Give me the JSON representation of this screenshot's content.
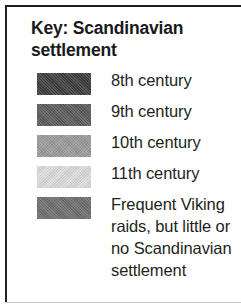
{
  "legend": {
    "title": "Key: Scandinavian settlement",
    "border_color": "#231f20",
    "text_color": "#231f20",
    "background": "#ffffff",
    "entries": [
      {
        "swatch_name": "swatch-8th-century",
        "color": "#3c3c3c",
        "label": "8th century",
        "lines": [
          "8th century"
        ]
      },
      {
        "swatch_name": "swatch-9th-century",
        "color": "#5a5a5a",
        "label": "9th century",
        "lines": [
          "9th century"
        ]
      },
      {
        "swatch_name": "swatch-10th-century",
        "color": "#9b9b9b",
        "label": "10th century",
        "lines": [
          "10th century"
        ]
      },
      {
        "swatch_name": "swatch-11th-century",
        "color": "#dedede",
        "label": "11th century",
        "lines": [
          "11th century"
        ]
      },
      {
        "swatch_name": "swatch-viking-raids",
        "color": "#6e6e6e",
        "label": "Frequent Viking raids, but little or no Scandinavian settlement",
        "lines": [
          "Frequent Viking",
          "raids, but little or",
          "no Scandinavian",
          "settlement"
        ]
      }
    ]
  }
}
